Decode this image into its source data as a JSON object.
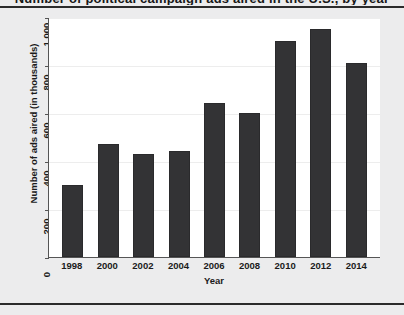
{
  "page": {
    "clipped_header_text": "Number of political campaign ads aired in the U.S., by year"
  },
  "chart_data": {
    "type": "bar",
    "title": "",
    "xlabel": "Year",
    "ylabel": "Number of ads aired (in thousands)",
    "categories": [
      "1998",
      "2000",
      "2002",
      "2004",
      "2006",
      "2008",
      "2010",
      "2012",
      "2014"
    ],
    "values": [
      300,
      470,
      430,
      440,
      640,
      600,
      900,
      950,
      810
    ],
    "ylim": [
      0,
      1000
    ],
    "yticks": [
      0,
      200,
      400,
      600,
      800,
      1000
    ],
    "ytick_labels": [
      "0",
      "200",
      "400",
      "600",
      "800",
      "1,000"
    ],
    "grid": true,
    "legend": null,
    "bar_color": "#333335",
    "panel_color": "#ffffff",
    "page_color": "#ececed"
  }
}
